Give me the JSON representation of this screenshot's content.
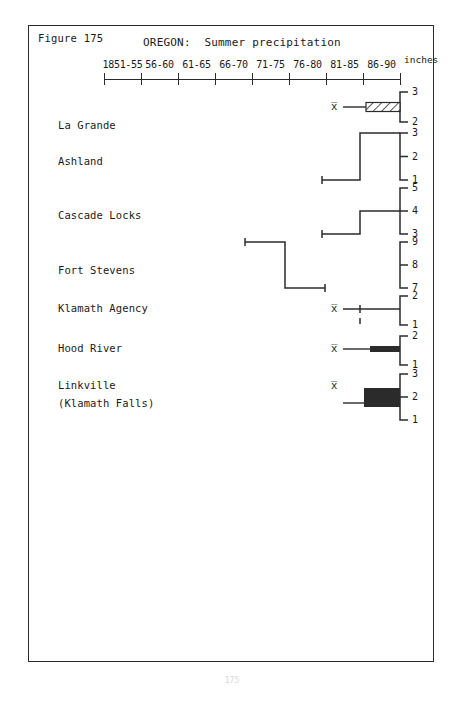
{
  "figure": {
    "label": "Figure 175",
    "title": "OREGON:  Summer precipitation",
    "units_label": "inches",
    "page_number": "175"
  },
  "axis": {
    "tick_labels": [
      "1851-55",
      "56-60",
      "61-65",
      "66-70",
      "71-75",
      "76-80",
      "81-85",
      "86-90"
    ],
    "tick_count": 9,
    "x_start_px": 104,
    "x_end_px": 400,
    "spacing_px": 37
  },
  "chart_data": {
    "type": "line",
    "title": "OREGON:  Summer precipitation",
    "xlabel": "",
    "ylabel": "inches",
    "categories": [
      "1851-55",
      "56-60",
      "61-65",
      "66-70",
      "71-75",
      "76-80",
      "81-85",
      "86-90"
    ],
    "grid": false,
    "legend": "none",
    "series": [
      {
        "name": "La Grande",
        "scale_ticks": [
          "3",
          "2"
        ],
        "mean_marker": "x̅",
        "style": "hatched-bar",
        "segments": [
          {
            "from_category": "81-85",
            "to_category": "86-90",
            "value": 2.5
          }
        ]
      },
      {
        "name": "Ashland",
        "scale_ticks": [
          "3",
          "2",
          "1"
        ],
        "mean_marker": "",
        "style": "step-line",
        "segments": [
          {
            "from_category": "76-80",
            "to_category": "81-85",
            "value": 1
          },
          {
            "from_category": "81-85",
            "to_category": "86-90",
            "value": 3
          }
        ]
      },
      {
        "name": "Cascade Locks",
        "scale_ticks": [
          "5",
          "4",
          "3"
        ],
        "mean_marker": "",
        "style": "step-line",
        "segments": [
          {
            "from_category": "76-80",
            "to_category": "81-85",
            "value": 3
          },
          {
            "from_category": "81-85",
            "to_category": "86-90",
            "value": 4
          }
        ]
      },
      {
        "name": "Fort Stevens",
        "scale_ticks": [
          "9",
          "8",
          "7"
        ],
        "mean_marker": "",
        "style": "step-line",
        "segments": [
          {
            "from_category": "66-70",
            "to_category": "71-75",
            "value": 9
          },
          {
            "from_category": "71-75",
            "to_category": "76-80",
            "value": 7
          }
        ]
      },
      {
        "name": "Klamath Agency",
        "scale_ticks": [
          "2",
          "1"
        ],
        "mean_marker": "x̅",
        "style": "line-with-tick",
        "segments": [
          {
            "from_category": "81-85",
            "to_category": "86-90",
            "value": 1.5
          }
        ]
      },
      {
        "name": "Hood River",
        "scale_ticks": [
          "2",
          "1"
        ],
        "mean_marker": "x̅",
        "style": "solid-bar",
        "segments": [
          {
            "from_category": "81-85",
            "to_category": "86-90",
            "value": 1.5
          }
        ]
      },
      {
        "name": "Linkville",
        "name_line2": "(Klamath Falls)",
        "scale_ticks": [
          "3",
          "2",
          "1"
        ],
        "mean_marker": "x̅",
        "style": "solid-bar-tall",
        "segments": [
          {
            "from_category": "81-85",
            "to_category": "86-90",
            "value": 2
          }
        ]
      }
    ]
  },
  "rows": [
    {
      "label": "La Grande",
      "label2": "",
      "mean": "x̅",
      "ticks": [
        "3",
        "2"
      ]
    },
    {
      "label": "Ashland",
      "label2": "",
      "mean": "",
      "ticks": [
        "3",
        "2",
        "1"
      ]
    },
    {
      "label": "Cascade Locks",
      "label2": "",
      "mean": "",
      "ticks": [
        "5",
        "4",
        "3"
      ]
    },
    {
      "label": "Fort Stevens",
      "label2": "",
      "mean": "",
      "ticks": [
        "9",
        "8",
        "7"
      ]
    },
    {
      "label": "Klamath Agency",
      "label2": "",
      "mean": "x̅",
      "ticks": [
        "2",
        "1"
      ]
    },
    {
      "label": "Hood River",
      "label2": "",
      "mean": "x̅",
      "ticks": [
        "2",
        "1"
      ]
    },
    {
      "label": "Linkville",
      "label2": "(Klamath Falls)",
      "mean": "x̅",
      "ticks": [
        "3",
        "2",
        "1"
      ]
    }
  ],
  "colors": {
    "ink": "#2b2b2b",
    "paper": "#ffffff",
    "page_number": "#d8d8d8"
  }
}
